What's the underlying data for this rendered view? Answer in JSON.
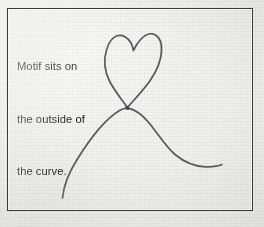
{
  "figure": {
    "kind": "hand-drawn-embroidery-diagram",
    "background_color": "#efefed",
    "border_color": "#3a3a3c",
    "ink_color": "#4a4a50",
    "caption": {
      "lines": [
        "Motif sits on",
        "the outside of",
        "the curve."
      ],
      "full_text": "Motif sits on the outside of the curve.",
      "color": "#17171a"
    },
    "drawing": {
      "elements": [
        {
          "name": "heart-motif",
          "label": "heart",
          "description": "hand-drawn heart outline sitting above and outside the curve",
          "bottom_point": [
            127,
            108
          ],
          "left_lobe_top": [
            113,
            36
          ],
          "right_lobe_top": [
            152,
            34
          ],
          "center_dip": [
            133,
            50
          ]
        },
        {
          "name": "s-curve",
          "label": "curve",
          "description": "hand-drawn S-shaped curve; the heart touches its apex from the outside",
          "left_tail_end": [
            62,
            198
          ],
          "apex": [
            127,
            108
          ],
          "inflection": [
            176,
            152
          ],
          "right_tail_end": [
            222,
            165
          ]
        }
      ]
    }
  }
}
